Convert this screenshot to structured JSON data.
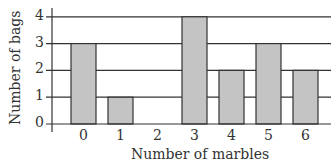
{
  "chart_data": {
    "type": "bar",
    "title": "",
    "xlabel": "Number of marbles",
    "ylabel": "Number of bags",
    "categories": [
      "0",
      "1",
      "2",
      "3",
      "4",
      "5",
      "6"
    ],
    "values": [
      3,
      1,
      0,
      4,
      2,
      3,
      2
    ],
    "ylim": [
      0,
      4
    ],
    "yticks": [
      "0",
      "1",
      "2",
      "3",
      "4"
    ],
    "grid": true,
    "legend": null,
    "colors": {
      "bar_fill": "#c4c4c4",
      "bar_edge": "#333333",
      "grid": "#333333"
    }
  }
}
